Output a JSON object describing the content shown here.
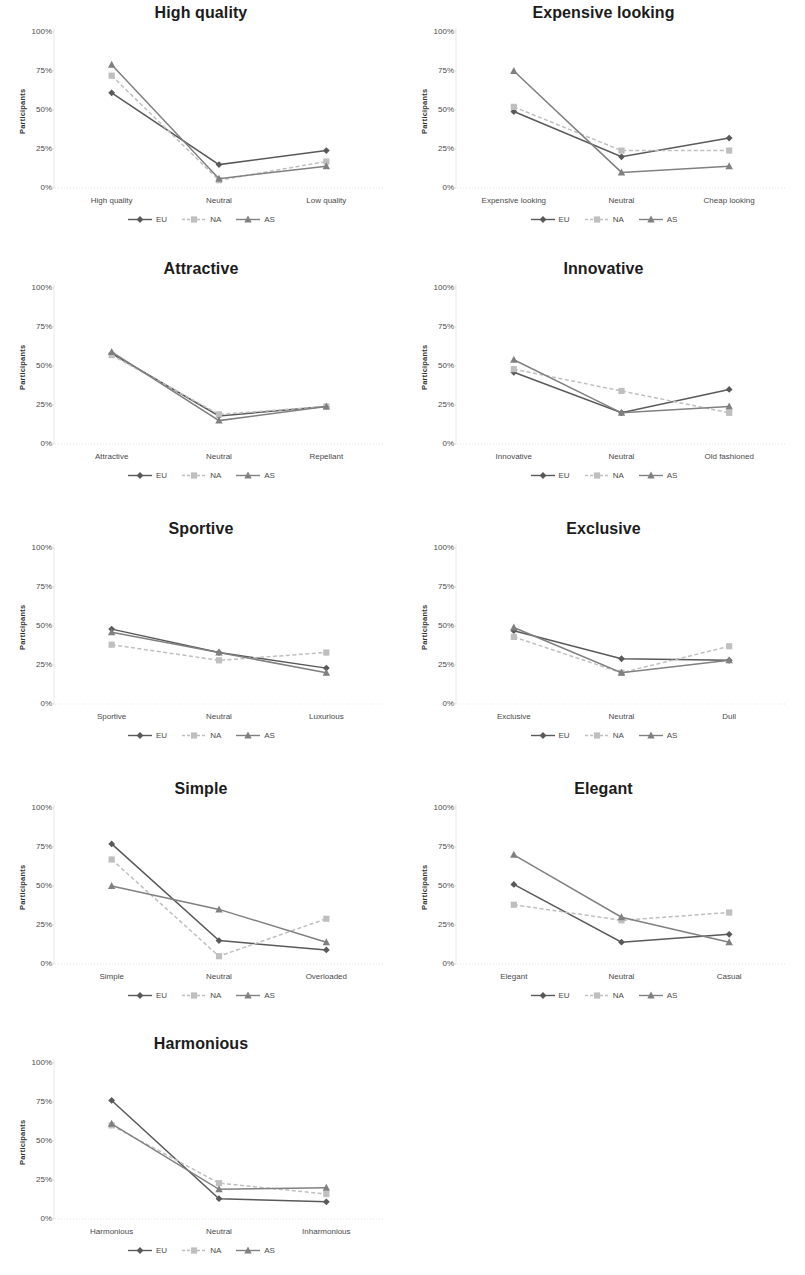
{
  "figure": {
    "y_axis_label": "Participants",
    "y_ticks": [
      "0%",
      "25%",
      "50%",
      "75%",
      "100%"
    ],
    "legend_labels": [
      "EU",
      "NA",
      "AS"
    ],
    "series_colors": {
      "EU": "#595959",
      "NA": "#bfbfbf",
      "AS": "#808080"
    },
    "series_markers": {
      "EU": "diamond",
      "NA": "square",
      "AS": "triangle"
    },
    "series_dash": {
      "EU": "solid",
      "NA": "dashed",
      "AS": "solid"
    }
  },
  "chart_data": [
    {
      "type": "line",
      "title": "High quality",
      "xlabel": "",
      "ylabel": "Participants",
      "categories": [
        "High quality",
        "Neutral",
        "Low quality"
      ],
      "ylim": [
        0,
        100
      ],
      "yticks": [
        0,
        25,
        50,
        75,
        100
      ],
      "grid": false,
      "legend_position": "bottom",
      "series": [
        {
          "name": "EU",
          "values": [
            61,
            15,
            24
          ]
        },
        {
          "name": "NA",
          "values": [
            72,
            5,
            17
          ]
        },
        {
          "name": "AS",
          "values": [
            79,
            6,
            14
          ]
        }
      ]
    },
    {
      "type": "line",
      "title": "Expensive looking",
      "xlabel": "",
      "ylabel": "Participants",
      "categories": [
        "Expensive looking",
        "Neutral",
        "Cheap looking"
      ],
      "ylim": [
        0,
        100
      ],
      "yticks": [
        0,
        25,
        50,
        75,
        100
      ],
      "grid": false,
      "legend_position": "bottom",
      "series": [
        {
          "name": "EU",
          "values": [
            49,
            20,
            32
          ]
        },
        {
          "name": "NA",
          "values": [
            52,
            24,
            24
          ]
        },
        {
          "name": "AS",
          "values": [
            75,
            10,
            14
          ]
        }
      ]
    },
    {
      "type": "line",
      "title": "Attractive",
      "xlabel": "",
      "ylabel": "Participants",
      "categories": [
        "Attractive",
        "Neutral",
        "Repellant"
      ],
      "ylim": [
        0,
        100
      ],
      "yticks": [
        0,
        25,
        50,
        75,
        100
      ],
      "grid": false,
      "legend_position": "bottom",
      "series": [
        {
          "name": "EU",
          "values": [
            58,
            18,
            24
          ]
        },
        {
          "name": "NA",
          "values": [
            57,
            19,
            24
          ]
        },
        {
          "name": "AS",
          "values": [
            59,
            15,
            24
          ]
        }
      ]
    },
    {
      "type": "line",
      "title": "Innovative",
      "xlabel": "",
      "ylabel": "Participants",
      "categories": [
        "Innovative",
        "Neutral",
        "Old fashioned"
      ],
      "ylim": [
        0,
        100
      ],
      "yticks": [
        0,
        25,
        50,
        75,
        100
      ],
      "grid": false,
      "legend_position": "bottom",
      "series": [
        {
          "name": "EU",
          "values": [
            46,
            20,
            35
          ]
        },
        {
          "name": "NA",
          "values": [
            48,
            34,
            20
          ]
        },
        {
          "name": "AS",
          "values": [
            54,
            20,
            24
          ]
        }
      ]
    },
    {
      "type": "line",
      "title": "Sportive",
      "xlabel": "",
      "ylabel": "Participants",
      "categories": [
        "Sportive",
        "Neutral",
        "Luxurious"
      ],
      "ylim": [
        0,
        100
      ],
      "yticks": [
        0,
        25,
        50,
        75,
        100
      ],
      "grid": false,
      "legend_position": "bottom",
      "series": [
        {
          "name": "EU",
          "values": [
            48,
            33,
            23
          ]
        },
        {
          "name": "NA",
          "values": [
            38,
            28,
            33
          ]
        },
        {
          "name": "AS",
          "values": [
            46,
            33,
            20
          ]
        }
      ]
    },
    {
      "type": "line",
      "title": "Exclusive",
      "xlabel": "",
      "ylabel": "Participants",
      "categories": [
        "Exclusive",
        "Neutral",
        "Dull"
      ],
      "ylim": [
        0,
        100
      ],
      "yticks": [
        0,
        25,
        50,
        75,
        100
      ],
      "grid": false,
      "legend_position": "bottom",
      "series": [
        {
          "name": "EU",
          "values": [
            47,
            29,
            28
          ]
        },
        {
          "name": "NA",
          "values": [
            43,
            20,
            37
          ]
        },
        {
          "name": "AS",
          "values": [
            49,
            20,
            28
          ]
        }
      ]
    },
    {
      "type": "line",
      "title": "Simple",
      "xlabel": "",
      "ylabel": "Participants",
      "categories": [
        "Simple",
        "Neutral",
        "Overloaded"
      ],
      "ylim": [
        0,
        100
      ],
      "yticks": [
        0,
        25,
        50,
        75,
        100
      ],
      "grid": false,
      "legend_position": "bottom",
      "series": [
        {
          "name": "EU",
          "values": [
            77,
            15,
            9
          ]
        },
        {
          "name": "NA",
          "values": [
            67,
            5,
            29
          ]
        },
        {
          "name": "AS",
          "values": [
            50,
            35,
            14
          ]
        }
      ]
    },
    {
      "type": "line",
      "title": "Elegant",
      "xlabel": "",
      "ylabel": "Participants",
      "categories": [
        "Elegant",
        "Neutral",
        "Casual"
      ],
      "ylim": [
        0,
        100
      ],
      "yticks": [
        0,
        25,
        50,
        75,
        100
      ],
      "grid": false,
      "legend_position": "bottom",
      "series": [
        {
          "name": "EU",
          "values": [
            51,
            14,
            19
          ]
        },
        {
          "name": "NA",
          "values": [
            38,
            28,
            33
          ]
        },
        {
          "name": "AS",
          "values": [
            70,
            30,
            14
          ]
        }
      ]
    },
    {
      "type": "line",
      "title": "Harmonious",
      "xlabel": "",
      "ylabel": "Participants",
      "categories": [
        "Harmonious",
        "Neutral",
        "Inharmonious"
      ],
      "ylim": [
        0,
        100
      ],
      "yticks": [
        0,
        25,
        50,
        75,
        100
      ],
      "grid": false,
      "legend_position": "bottom",
      "series": [
        {
          "name": "EU",
          "values": [
            76,
            13,
            11
          ]
        },
        {
          "name": "NA",
          "values": [
            60,
            23,
            16
          ]
        },
        {
          "name": "AS",
          "values": [
            61,
            19,
            20
          ]
        }
      ]
    }
  ]
}
